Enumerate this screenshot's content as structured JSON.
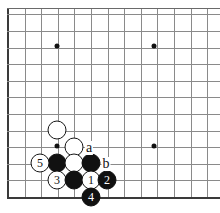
{
  "diagram": {
    "type": "go-board-diagram",
    "board": {
      "grid_spacing": 16.6,
      "origin_x": 8,
      "bottom_y": 197,
      "cols": 13,
      "rows": 12,
      "line_color": "#8a8a8a",
      "edge_color": "#3a3a3a",
      "background": "#ffffff"
    },
    "star_points": [
      {
        "cx": 57,
        "cy": 46
      },
      {
        "cx": 154,
        "cy": 46
      },
      {
        "cx": 57,
        "cy": 146
      },
      {
        "cx": 154,
        "cy": 146
      }
    ],
    "stones": [
      {
        "id": "w-upper",
        "color": "white",
        "cx": 57,
        "cy": 130,
        "r": 9.5,
        "label": ""
      },
      {
        "id": "w-mid",
        "color": "white",
        "cx": 74,
        "cy": 147,
        "r": 9.5,
        "label": ""
      },
      {
        "id": "b-left",
        "color": "black",
        "cx": 57,
        "cy": 163,
        "r": 9.5,
        "label": ""
      },
      {
        "id": "w-center",
        "color": "white",
        "cx": 74,
        "cy": 163,
        "r": 9.5,
        "label": ""
      },
      {
        "id": "b-right",
        "color": "black",
        "cx": 91,
        "cy": 163,
        "r": 9.5,
        "label": ""
      },
      {
        "id": "w-5",
        "color": "white",
        "cx": 40,
        "cy": 163,
        "r": 9.5,
        "label": "5"
      },
      {
        "id": "w-3",
        "color": "white",
        "cx": 57,
        "cy": 180,
        "r": 9.5,
        "label": "3"
      },
      {
        "id": "b-low",
        "color": "black",
        "cx": 74,
        "cy": 180,
        "r": 9.5,
        "label": ""
      },
      {
        "id": "w-1",
        "color": "white",
        "cx": 91,
        "cy": 180,
        "r": 9.5,
        "label": "1"
      },
      {
        "id": "b-2",
        "color": "black",
        "cx": 107,
        "cy": 180,
        "r": 9.5,
        "label": "2"
      },
      {
        "id": "b-4",
        "color": "black",
        "cx": 91,
        "cy": 197,
        "r": 9.5,
        "label": "4"
      }
    ],
    "letter_markers": [
      {
        "id": "marker-a",
        "label": "a",
        "cx": 89,
        "cy": 148
      },
      {
        "id": "marker-b",
        "label": "b",
        "cx": 106,
        "cy": 164
      }
    ],
    "move_numbers": [
      "1",
      "2",
      "3",
      "4",
      "5"
    ],
    "move_order": [
      {
        "number": "1",
        "color": "white"
      },
      {
        "number": "2",
        "color": "black"
      },
      {
        "number": "3",
        "color": "white"
      },
      {
        "number": "4",
        "color": "black"
      },
      {
        "number": "5",
        "color": "white"
      }
    ]
  }
}
